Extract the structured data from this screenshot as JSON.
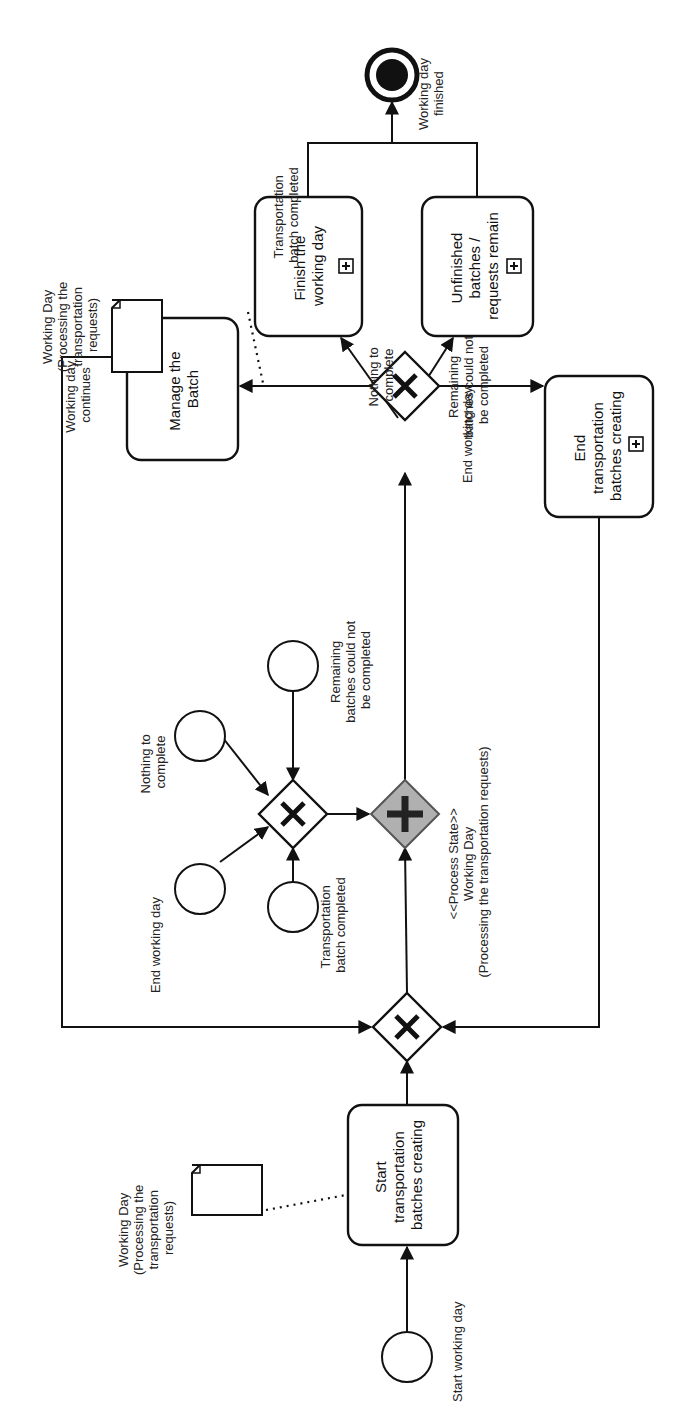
{
  "diagram": {
    "orientation": "rotated-90-ccw",
    "events": {
      "start": {
        "label": "Start working day"
      },
      "end": {
        "label_lines": [
          "Working day",
          "finished"
        ]
      },
      "intermediate": [
        {
          "id": "end-working-day",
          "label": "End working day"
        },
        {
          "id": "nothing-to-complete",
          "label_lines": [
            "Nothing to",
            "complete"
          ]
        },
        {
          "id": "transportation-batch-completed",
          "label_lines": [
            "Transportation",
            "batch completed"
          ]
        },
        {
          "id": "remaining-batches",
          "label_lines": [
            "Remaining",
            "batches could not",
            "be completed"
          ]
        }
      ]
    },
    "tasks": {
      "start_batches": {
        "label_lines": [
          "Start",
          "transportation",
          "batches creating"
        ]
      },
      "manage_batch": {
        "label_lines": [
          "Manage the",
          "Batch"
        ]
      },
      "end_batches": {
        "label_lines": [
          "End",
          "transportation",
          "batches creating"
        ],
        "subprocess": true
      },
      "finish_day": {
        "label_lines": [
          "Finish the",
          "working day"
        ],
        "subprocess": true
      },
      "unfinished": {
        "label_lines": [
          "Unfinished",
          "batches /",
          "requests remain"
        ],
        "subprocess": true
      }
    },
    "data_objects": [
      {
        "id": "data-object-top",
        "label_lines": [
          "Working Day",
          "(Processing the",
          "transportation",
          "requests)"
        ]
      },
      {
        "id": "data-object-bottom",
        "label_lines": [
          "Working Day",
          "(Processing the",
          "transportation",
          "requests)"
        ]
      }
    ],
    "parallel_gateway": {
      "label_lines": [
        "<<Process State>>",
        "Working Day",
        "(Processing the transportation requests)"
      ]
    },
    "flow_labels": {
      "working_day_continues": [
        "Working day",
        "continues"
      ],
      "transportation_batch_completed": [
        "Transportation",
        "batch completed"
      ],
      "end_working_day": "End working day",
      "nothing_to_complete": [
        "Nothing to",
        "complete"
      ],
      "remaining_batches": [
        "Remaining",
        "batches could not",
        "be completed"
      ]
    },
    "colors": {
      "line": "#111111",
      "parallel_gateway_fill": "#b0b0b0",
      "background": "#ffffff"
    }
  }
}
